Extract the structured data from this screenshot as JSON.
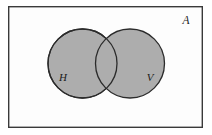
{
  "diagram": {
    "type": "venn-diagram",
    "universe": {
      "label": "A",
      "name": "universal-set",
      "shape": "rectangle",
      "x": 8,
      "y": 6,
      "width": 195,
      "height": 122,
      "fill": "#ffffff",
      "stroke": "#3a3a3a",
      "stroke_width": 1.4,
      "label_x": 186,
      "label_y": 24
    },
    "sets": [
      {
        "label": "H",
        "name": "set-h",
        "shape": "circle",
        "cx": 82.5,
        "cy": 63.5,
        "r": 34.5,
        "fill": "#adadad",
        "stroke": "#2b2b2b",
        "stroke_width": 1.3,
        "label_x": 63,
        "label_y": 81
      },
      {
        "label": "V",
        "name": "set-v",
        "shape": "circle",
        "cx": 130.0,
        "cy": 63.5,
        "r": 34.5,
        "fill": "#adadad",
        "stroke": "#2b2b2b",
        "stroke_width": 1.3,
        "label_x": 147,
        "label_y": 81
      }
    ],
    "intersection": {
      "name": "intersection-region",
      "label": "",
      "fill": "#adadad",
      "shaded": true
    },
    "colors": {
      "set_fill": "#adadad",
      "set_stroke": "#2b2b2b",
      "frame_stroke": "#3a3a3a",
      "background": "#ffffff",
      "label_color": "#1a1a1a"
    }
  }
}
